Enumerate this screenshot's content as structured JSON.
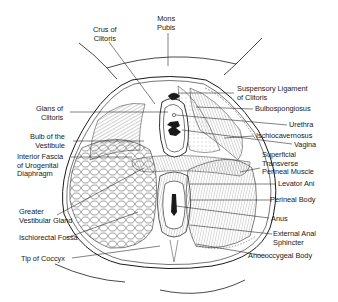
{
  "colors": {
    "ink": "#1a1a1a",
    "background": "#ffffff",
    "shading": "#cfcfcf"
  },
  "labels": {
    "mons_pubis": [
      "Mons",
      "Pubis"
    ],
    "crus_of_clitoris": [
      "Crus of",
      "Clitoris"
    ],
    "glans_of_clitoris": [
      "Glans of",
      "Clitoris"
    ],
    "bulb_of_vestibule": [
      "Bulb of the",
      "Vestibule"
    ],
    "interior_fascia": [
      "Interior Fascia",
      "of Urogenital",
      "Diaphragm"
    ],
    "greater_vestibular_gland": [
      "Greater",
      "Vestibular Gland"
    ],
    "ischiorectal_fossa": [
      "Ischiorectal Fossa"
    ],
    "tip_of_coccyx": [
      "Tip of Coccyx"
    ],
    "suspensory_ligament": [
      "Suspensory Ligament",
      "of Clitoris"
    ],
    "bulbospongiosus": [
      "Bulbospongiosus"
    ],
    "urethra": [
      "Urethra"
    ],
    "ischiocavernosus": [
      "Ischiocavernosus"
    ],
    "vagina": [
      "Vagina"
    ],
    "superficial_transverse_perineal_muscle": [
      "Superficial",
      "Transverse",
      "Perineal Muscle"
    ],
    "levator_ani": [
      "Levator Ani"
    ],
    "perineal_body": [
      "Perineal Body"
    ],
    "anus": [
      "Anus"
    ],
    "external_anal_sphincter": [
      "External Anal",
      "Sphincter"
    ],
    "anococcygeal_body": [
      "Anococcygeal Body"
    ]
  }
}
